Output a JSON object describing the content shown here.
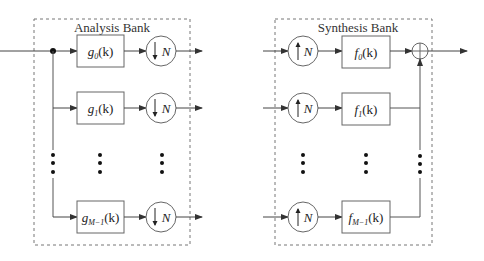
{
  "analysis_bank": {
    "title": "Analysis Bank",
    "filters": [
      {
        "name": "g",
        "sub": "0",
        "arg": "(k)"
      },
      {
        "name": "g",
        "sub": "1",
        "arg": "(k)"
      },
      {
        "name": "g",
        "sub": "M−1",
        "arg": "(k)"
      }
    ],
    "decimator_label": "N",
    "decimator_icon": "down-arrow-icon"
  },
  "synthesis_bank": {
    "title": "Synthesis Bank",
    "filters": [
      {
        "name": "f",
        "sub": "0",
        "arg": "(k)"
      },
      {
        "name": "f",
        "sub": "1",
        "arg": "(k)"
      },
      {
        "name": "f",
        "sub": "M−1",
        "arg": "(k)"
      }
    ],
    "expander_label": "N",
    "expander_icon": "up-arrow-icon",
    "adder_icon": "plus-icon"
  },
  "colors": {
    "line": "#555555",
    "box": "#666666",
    "dashed": "#777777",
    "dot": "#111111"
  }
}
